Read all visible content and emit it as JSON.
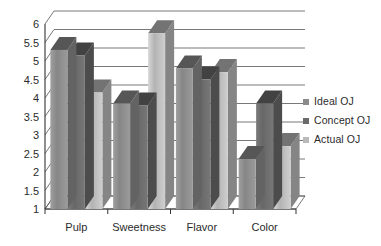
{
  "chart_data": {
    "type": "bar",
    "title": "",
    "subtitle": "",
    "xlabel": "",
    "ylabel": "",
    "categories": [
      "Pulp",
      "Sweetness",
      "Flavor",
      "Color"
    ],
    "series": [
      {
        "name": "Ideal OJ",
        "color": "#8a8a8a",
        "values": [
          5.3,
          3.85,
          4.8,
          2.35
        ]
      },
      {
        "name": "Concept OJ",
        "color": "#6a6a6a",
        "values": [
          5.15,
          3.8,
          4.5,
          3.85
        ]
      },
      {
        "name": "Actual OJ",
        "color": "#b9b9b9",
        "values": [
          4.15,
          5.75,
          4.7,
          2.7
        ]
      }
    ],
    "ylim": [
      1,
      6
    ],
    "ytick_step": 0.5,
    "yticks": [
      "1",
      "1.5",
      "2",
      "2.5",
      "3",
      "3.5",
      "4",
      "4.5",
      "5",
      "5.5",
      "6"
    ],
    "grid": true,
    "grid_axis": "y",
    "legend_position": "right",
    "style": "3d-columns-grayscale"
  },
  "legend": {
    "items": [
      {
        "label": "Ideal OJ",
        "swatch": "#8a8a8a"
      },
      {
        "label": "Concept OJ",
        "swatch": "#6a6a6a"
      },
      {
        "label": "Actual OJ",
        "swatch": "#b9b9b9"
      }
    ]
  }
}
